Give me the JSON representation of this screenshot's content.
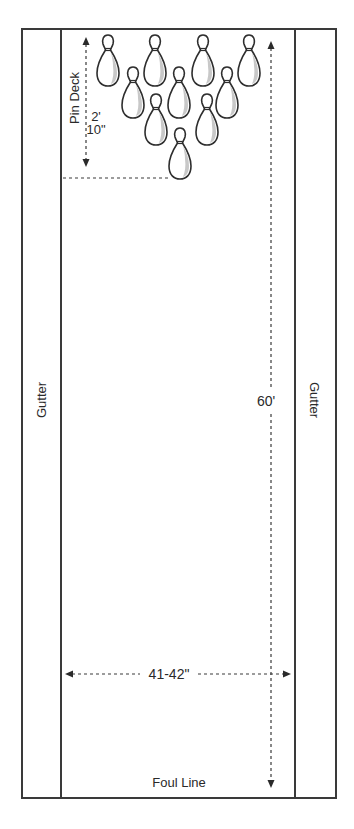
{
  "diagram": {
    "labels": {
      "left_gutter": "Gutter",
      "right_gutter": "Gutter",
      "pin_deck": "Pin Deck",
      "pin_deck_len_feet": "2'",
      "pin_deck_len_inches": "10\"",
      "lane_length": "60'",
      "lane_width": "41-42\"",
      "foul_line": "Foul Line"
    },
    "pins": {
      "count": 10,
      "rows": [
        {
          "row": 4,
          "x": [
            108,
            155,
            203,
            249
          ],
          "top": 35
        },
        {
          "row": 3,
          "x": [
            133,
            179,
            227
          ],
          "top": 67
        },
        {
          "row": 2,
          "x": [
            156,
            207
          ],
          "top": 94
        },
        {
          "row": 1,
          "x": [
            180
          ],
          "top": 128
        }
      ]
    },
    "colors": {
      "line": "#3a3a3a",
      "text": "#2a2a2a",
      "pin_shade": "#c8c8c8",
      "background": "#ffffff"
    }
  }
}
